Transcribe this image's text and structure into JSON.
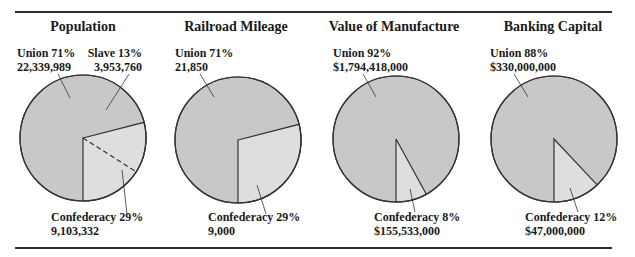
{
  "colors": {
    "union_fill": "#c8c8c8",
    "other_fill": "#dedede",
    "stroke": "#333333",
    "text": "#1a1a1a"
  },
  "chart_data": [
    {
      "type": "pie",
      "title": "Population",
      "slices": [
        {
          "name": "Union",
          "percent": 71,
          "value": "22,339,989",
          "label": "Union 71%"
        },
        {
          "name": "Confederacy",
          "percent": 29,
          "value": "9,103,332",
          "label": "Confederacy 29%",
          "subdivision": {
            "name": "Slave",
            "percent": 13,
            "value": "3,953,760",
            "label": "Slave 13%",
            "divider": "dashed"
          }
        }
      ]
    },
    {
      "type": "pie",
      "title": "Railroad Mileage",
      "slices": [
        {
          "name": "Union",
          "percent": 71,
          "value": "21,850",
          "label": "Union 71%"
        },
        {
          "name": "Confederacy",
          "percent": 29,
          "value": "9,000",
          "label": "Confederacy 29%"
        }
      ]
    },
    {
      "type": "pie",
      "title": "Value of Manufacture",
      "slices": [
        {
          "name": "Union",
          "percent": 92,
          "value": "$1,794,418,000",
          "label": "Union 92%"
        },
        {
          "name": "Confederacy",
          "percent": 8,
          "value": "$155,533,000",
          "label": "Confederacy 8%"
        }
      ]
    },
    {
      "type": "pie",
      "title": "Banking Capital",
      "slices": [
        {
          "name": "Union",
          "percent": 88,
          "value": "$330,000,000",
          "label": "Union 88%"
        },
        {
          "name": "Confederacy",
          "percent": 12,
          "value": "$47,000,000",
          "label": "Confederacy 12%"
        }
      ]
    }
  ]
}
